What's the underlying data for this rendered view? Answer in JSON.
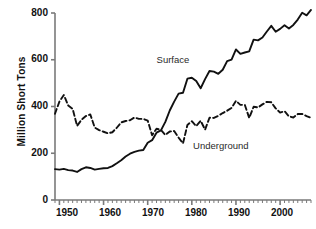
{
  "chart_data": {
    "type": "line",
    "title": "",
    "xlabel": "",
    "ylabel": "Million Short Tons",
    "xlim": [
      1949,
      2007
    ],
    "ylim": [
      0,
      800
    ],
    "grid": false,
    "legend_position": "inline-annotations",
    "yticks": [
      0,
      200,
      400,
      600,
      800
    ],
    "ytick_labels": [
      "0",
      "200",
      "400",
      "600",
      "800"
    ],
    "xticks": [
      1950,
      1960,
      1970,
      1980,
      1990,
      2000
    ],
    "xtick_labels": [
      "1950",
      "1960",
      "1970",
      "1980",
      "1990",
      "2000"
    ],
    "minor_xticks_interval": 1,
    "x": [
      1949,
      1950,
      1951,
      1952,
      1953,
      1954,
      1955,
      1956,
      1957,
      1958,
      1959,
      1960,
      1961,
      1962,
      1963,
      1964,
      1965,
      1966,
      1967,
      1968,
      1969,
      1970,
      1971,
      1972,
      1973,
      1974,
      1975,
      1976,
      1977,
      1978,
      1979,
      1980,
      1981,
      1982,
      1983,
      1984,
      1985,
      1986,
      1987,
      1988,
      1989,
      1990,
      1991,
      1992,
      1993,
      1994,
      1995,
      1996,
      1997,
      1998,
      1999,
      2000,
      2001,
      2002,
      2003,
      2004,
      2005,
      2006,
      2007
    ],
    "series": [
      {
        "name": "Surface",
        "style": "solid",
        "color": "#111111",
        "values": [
          132,
          130,
          133,
          128,
          126,
          120,
          132,
          140,
          137,
          130,
          133,
          136,
          137,
          145,
          157,
          170,
          186,
          198,
          206,
          211,
          214,
          245,
          256,
          288,
          298,
          334,
          383,
          421,
          455,
          459,
          519,
          523,
          509,
          478,
          517,
          552,
          549,
          540,
          557,
          594,
          601,
          644,
          625,
          631,
          636,
          686,
          683,
          695,
          721,
          745,
          720,
          732,
          748,
          734,
          749,
          772,
          801,
          790,
          813
        ]
      },
      {
        "name": "Underground",
        "style": "dashed",
        "color": "#111111",
        "values": [
          369,
          421,
          449,
          404,
          390,
          317,
          343,
          359,
          366,
          310,
          299,
          292,
          285,
          290,
          309,
          332,
          338,
          341,
          353,
          347,
          347,
          340,
          277,
          305,
          300,
          278,
          293,
          295,
          267,
          242,
          321,
          337,
          316,
          339,
          301,
          352,
          351,
          360,
          372,
          382,
          394,
          424,
          407,
          407,
          351,
          399,
          396,
          409,
          420,
          418,
          392,
          374,
          380,
          358,
          353,
          368,
          368,
          359,
          352
        ]
      }
    ],
    "annotations": [
      {
        "text": "Surface",
        "x": 1977,
        "y": 600
      },
      {
        "text": "Underground",
        "x": 1983,
        "y": 230
      }
    ]
  },
  "plot_geometry": {
    "left": 55,
    "right": 311,
    "top": 13,
    "bottom": 200,
    "tick_len": 4,
    "minor_tick_len": 3,
    "axis_color": "#7a7a7a",
    "axis_width": 1.6,
    "line_width": 1.9,
    "dash_pattern": "5,3"
  }
}
